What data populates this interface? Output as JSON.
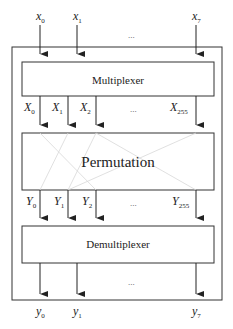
{
  "diagram": {
    "inputs": [
      {
        "base": "x",
        "sub": "0"
      },
      {
        "base": "x",
        "sub": "1"
      },
      {
        "base": "x",
        "sub": "7"
      }
    ],
    "inputs_ellipsis": "...",
    "multiplexer": {
      "label": "Multiplexer"
    },
    "mux_outputs": [
      {
        "base": "X",
        "sub": "0"
      },
      {
        "base": "X",
        "sub": "1"
      },
      {
        "base": "X",
        "sub": "2"
      },
      {
        "base": "X",
        "sub": "255"
      }
    ],
    "mux_outputs_ellipsis": "...",
    "permutation": {
      "label": "Permutation"
    },
    "perm_outputs": [
      {
        "base": "Y",
        "sub": "0"
      },
      {
        "base": "Y",
        "sub": "1"
      },
      {
        "base": "Y",
        "sub": "2"
      },
      {
        "base": "Y",
        "sub": "255"
      }
    ],
    "perm_outputs_ellipsis": "...",
    "demultiplexer": {
      "label": "Demultiplexer"
    },
    "outputs": [
      {
        "base": "y",
        "sub": "0"
      },
      {
        "base": "y",
        "sub": "1"
      },
      {
        "base": "y",
        "sub": "7"
      }
    ],
    "outputs_ellipsis": "..."
  }
}
